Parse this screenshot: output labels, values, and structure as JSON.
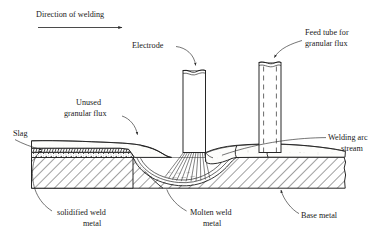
{
  "diagram": {
    "background_color": "#ffffff",
    "ink_color": "#1d1d1d",
    "labels": {
      "direction": "Direction of welding",
      "electrode": "Electrode",
      "feed_tube_line1": "Feed tube for",
      "feed_tube_line2": "granular flux",
      "unused_flux_line1": "Unused",
      "unused_flux_line2": "granular flux",
      "slag": "Slag",
      "welding_arc_line1": "Welding arc",
      "welding_arc_line2": "stream",
      "solidified_line1": "solidified weld",
      "solidified_line2": "metal",
      "molten_line1": "Molten weld",
      "molten_line2": "metal",
      "base_metal": "Base metal"
    },
    "icons": {
      "direction_arrow": "arrow-right-icon",
      "electrode_pointer": "curved-arrow-icon",
      "feed_tube_pointer": "curved-arrow-icon",
      "flux_pointer": "curved-arrow-icon",
      "slag_pointer": "arrow-left-icon"
    },
    "parts": {
      "electrode": "electrode-rod",
      "feed_tube": "flux-feed-tube",
      "flux_pile": "unused-granular-flux-layer",
      "slag_layer": "slag-layer",
      "solidified_weld": "solidified-weld-metal",
      "molten_pool": "molten-weld-metal-pool",
      "base_metal": "base-metal-plate",
      "arc_stream": "welding-arc-stream"
    }
  }
}
